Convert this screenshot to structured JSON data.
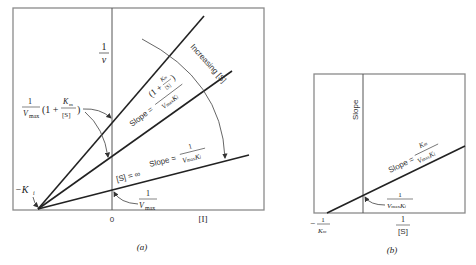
{
  "panel_a": {
    "caption": "(a)",
    "y_axis_label_num": "1",
    "y_axis_label_den": "v",
    "x_axis_zero": "0",
    "x_axis_label": "[I]",
    "x_intercept_label": "−K",
    "x_intercept_sub": "i",
    "upper_intercept": {
      "num": "1",
      "den": "V",
      "den_sub": "max",
      "paren_open": "(1 +",
      "frac_num": "K",
      "frac_num_sub": "m",
      "frac_den": "[S]",
      "paren_close": ")"
    },
    "lower_intercept": {
      "num": "1",
      "den": "V",
      "den_sub": "max"
    },
    "slope_upper": {
      "prefix": "Slope =",
      "num": "(1 + Km/[S])",
      "den": "Vmax Ki"
    },
    "slope_lower": {
      "prefix": "Slope =",
      "num": "1",
      "den": "Vmax Ki"
    },
    "s_infinity": "[S] = ∞",
    "arc_label": "Increasing [S]"
  },
  "panel_b": {
    "caption": "(b)",
    "y_axis_label": "Slope",
    "x_axis_label_num": "1",
    "x_axis_label_den": "[S]",
    "x_intercept": {
      "prefix": "−",
      "num": "1",
      "den": "K",
      "den_sub": "m"
    },
    "y_intercept": {
      "num": "1",
      "den": "Vmax Ki"
    },
    "slope": {
      "prefix": "Slope =",
      "num": "Km",
      "den": "Vmax Ki"
    }
  }
}
